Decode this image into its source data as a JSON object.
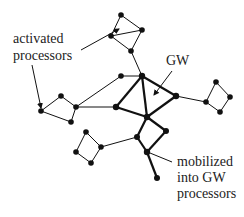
{
  "labels": {
    "activated_line1": "activated",
    "activated_line2": "processors",
    "gw": "GW",
    "mobilized_line1": "mobilized",
    "mobilized_line2": "into GW",
    "mobilized_line3": "processors"
  },
  "colors": {
    "ink": "#111111",
    "text": "#222222",
    "background": "#ffffff"
  },
  "nodes": [
    {
      "id": "t1",
      "x": 121,
      "y": 15
    },
    {
      "id": "t2",
      "x": 111,
      "y": 36
    },
    {
      "id": "t3",
      "x": 142,
      "y": 30
    },
    {
      "id": "t4",
      "x": 131,
      "y": 51
    },
    {
      "id": "hub",
      "x": 142,
      "y": 76
    },
    {
      "id": "n122",
      "x": 121,
      "y": 76
    },
    {
      "id": "l1",
      "x": 61,
      "y": 96
    },
    {
      "id": "l2",
      "x": 41,
      "y": 111
    },
    {
      "id": "l3",
      "x": 71,
      "y": 122
    },
    {
      "id": "l4",
      "x": 76,
      "y": 107
    },
    {
      "id": "gl",
      "x": 116,
      "y": 107
    },
    {
      "id": "gc",
      "x": 147,
      "y": 117
    },
    {
      "id": "gr",
      "x": 176,
      "y": 96
    },
    {
      "id": "b1",
      "x": 166,
      "y": 131
    },
    {
      "id": "b2",
      "x": 137,
      "y": 137
    },
    {
      "id": "b3",
      "x": 147,
      "y": 152
    },
    {
      "id": "b4",
      "x": 157,
      "y": 178
    },
    {
      "id": "s1",
      "x": 86,
      "y": 132
    },
    {
      "id": "s2",
      "x": 76,
      "y": 152
    },
    {
      "id": "s3",
      "x": 91,
      "y": 163
    },
    {
      "id": "s4",
      "x": 101,
      "y": 147
    },
    {
      "id": "r1",
      "x": 206,
      "y": 102
    },
    {
      "id": "r2",
      "x": 216,
      "y": 82
    },
    {
      "id": "r3",
      "x": 230,
      "y": 97
    },
    {
      "id": "r4",
      "x": 220,
      "y": 112
    }
  ]
}
